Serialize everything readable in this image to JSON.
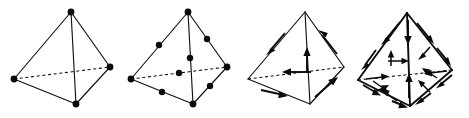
{
  "figure": {
    "background_color": "#ffffff",
    "ink_color": "#0a0a0a",
    "width": 469,
    "height": 118,
    "panel_count": 4,
    "caption": ""
  },
  "panels": [
    {
      "id": "panel-1",
      "name": "linear-nodal-tetrahedron",
      "label": "",
      "element_type": "nodal",
      "order": 1,
      "node_count": 4,
      "arrow_count": 0,
      "description": "Tetrahedron with solid edges, one dashed hidden edge, and filled circular nodes at the four corner vertices.",
      "origin_x": 0,
      "origin_y": 0,
      "vertices": {
        "apex": [
          71,
          12
        ],
        "left": [
          14,
          79
        ],
        "right": [
          110,
          67
        ],
        "bottom": [
          76,
          104
        ]
      },
      "nodes": [
        [
          71,
          12
        ],
        [
          14,
          79
        ],
        [
          110,
          67
        ],
        [
          76,
          104
        ]
      ],
      "edges_solid": [
        [
          "apex",
          "left"
        ],
        [
          "apex",
          "right"
        ],
        [
          "apex",
          "bottom"
        ],
        [
          "left",
          "bottom"
        ],
        [
          "right",
          "bottom"
        ]
      ],
      "edges_hidden": [
        [
          "left",
          "right"
        ]
      ]
    },
    {
      "id": "panel-2",
      "name": "quadratic-nodal-tetrahedron",
      "label": "",
      "element_type": "nodal",
      "order": 2,
      "node_count": 10,
      "arrow_count": 0,
      "description": "Tetrahedron with filled nodes at the four corners plus a midside node on each of the six edges, giving ten nodes.",
      "origin_x": 117,
      "origin_y": 0,
      "vertices": {
        "apex": [
          188,
          12
        ],
        "left": [
          131,
          79
        ],
        "right": [
          227,
          67
        ],
        "bottom": [
          193,
          104
        ]
      },
      "nodes": [
        [
          188,
          12
        ],
        [
          131,
          79
        ],
        [
          227,
          67
        ],
        [
          193,
          104
        ],
        [
          159,
          45
        ],
        [
          207,
          39
        ],
        [
          190,
          58
        ],
        [
          162,
          92
        ],
        [
          210,
          86
        ],
        [
          179,
          73
        ]
      ],
      "edges_solid": [
        [
          "apex",
          "left"
        ],
        [
          "apex",
          "right"
        ],
        [
          "apex",
          "bottom"
        ],
        [
          "left",
          "bottom"
        ],
        [
          "right",
          "bottom"
        ]
      ],
      "edges_hidden": [
        [
          "left",
          "right"
        ]
      ]
    },
    {
      "id": "panel-3",
      "name": "first-order-edge-tetrahedron",
      "label": "",
      "element_type": "edge",
      "order": 1,
      "node_count": 0,
      "arrow_count": 6,
      "description": "Tetrahedron whose six edges each carry a single tangential vector arrow at the edge midpoint.",
      "origin_x": 234,
      "origin_y": 0,
      "vertices": {
        "apex": [
          305,
          12
        ],
        "left": [
          248,
          79
        ],
        "right": [
          344,
          67
        ],
        "bottom": [
          310,
          104
        ]
      },
      "edges_solid": [
        [
          "apex",
          "left"
        ],
        [
          "apex",
          "right"
        ],
        [
          "apex",
          "bottom"
        ],
        [
          "left",
          "bottom"
        ],
        [
          "right",
          "bottom"
        ]
      ],
      "edges_hidden": [
        [
          "left",
          "right"
        ]
      ],
      "arrows": [
        {
          "name": "arrow-edge-apex-left",
          "from": [
            285,
            33
          ],
          "to": [
            266,
            55
          ],
          "direction": "down-left"
        },
        {
          "name": "arrow-edge-apex-right",
          "from": [
            337,
            54
          ],
          "to": [
            318,
            30
          ],
          "direction": "up-left"
        },
        {
          "name": "arrow-edge-apex-bottom",
          "from": [
            307,
            73
          ],
          "to": [
            307,
            48
          ],
          "direction": "up"
        },
        {
          "name": "arrow-edge-left-right",
          "from": [
            311,
            72
          ],
          "to": [
            282,
            72
          ],
          "direction": "left"
        },
        {
          "name": "arrow-edge-left-bottom",
          "from": [
            261,
            90
          ],
          "to": [
            288,
            96
          ],
          "direction": "down-right"
        },
        {
          "name": "arrow-edge-right-bottom",
          "from": [
            315,
            97
          ],
          "to": [
            338,
            77
          ],
          "direction": "up-right"
        }
      ]
    },
    {
      "id": "panel-4",
      "name": "second-order-edge-tetrahedron",
      "label": "",
      "element_type": "edge",
      "order": 2,
      "node_count": 0,
      "arrow_count": 20,
      "description": "Tetrahedron with two tangential vector arrows on each of the six edges and two vector arrows associated with each of the four faces, twenty degrees of freedom in total.",
      "origin_x": 350,
      "origin_y": 0,
      "vertices": {
        "apex": [
          407,
          13
        ],
        "left": [
          358,
          80
        ],
        "right": [
          452,
          70
        ],
        "bottom": [
          410,
          106
        ]
      },
      "edges_solid": [
        [
          "apex",
          "left"
        ],
        [
          "apex",
          "right"
        ],
        [
          "apex",
          "bottom"
        ],
        [
          "left",
          "bottom"
        ],
        [
          "right",
          "bottom"
        ]
      ],
      "edges_hidden": [
        [
          "left",
          "right"
        ]
      ],
      "arrows": [
        {
          "name": "arrow-edge-apex-left-a",
          "from": [
            398,
            24
          ],
          "to": [
            381,
            44
          ],
          "direction": "down-left"
        },
        {
          "name": "arrow-edge-apex-left-b",
          "from": [
            374,
            52
          ],
          "to": [
            362,
            70
          ],
          "direction": "down-left"
        },
        {
          "name": "arrow-edge-apex-right-a",
          "from": [
            419,
            25
          ],
          "to": [
            432,
            41
          ],
          "direction": "down-right"
        },
        {
          "name": "arrow-edge-apex-right-b",
          "from": [
            437,
            48
          ],
          "to": [
            449,
            63
          ],
          "direction": "down-right"
        },
        {
          "name": "arrow-edge-apex-bottom-a",
          "from": [
            408,
            22
          ],
          "to": [
            408,
            43
          ],
          "direction": "down"
        },
        {
          "name": "arrow-edge-apex-bottom-b",
          "from": [
            409,
            95
          ],
          "to": [
            409,
            74
          ],
          "direction": "up"
        },
        {
          "name": "arrow-edge-left-right-a",
          "from": [
            366,
            79
          ],
          "to": [
            389,
            76
          ],
          "direction": "right"
        },
        {
          "name": "arrow-edge-left-right-b",
          "from": [
            447,
            71
          ],
          "to": [
            424,
            74
          ],
          "direction": "left"
        },
        {
          "name": "arrow-edge-left-bottom-a",
          "from": [
            364,
            86
          ],
          "to": [
            379,
            95
          ],
          "direction": "down-right"
        },
        {
          "name": "arrow-edge-left-bottom-b",
          "from": [
            392,
            101
          ],
          "to": [
            406,
            107
          ],
          "direction": "down-right"
        },
        {
          "name": "arrow-edge-right-bottom-a",
          "from": [
            451,
            76
          ],
          "to": [
            437,
            88
          ],
          "direction": "down-left"
        },
        {
          "name": "arrow-edge-right-bottom-b",
          "from": [
            430,
            94
          ],
          "to": [
            416,
            104
          ],
          "direction": "down-left"
        },
        {
          "name": "arrow-face-front-a",
          "from": [
            391,
            66
          ],
          "to": [
            391,
            50
          ],
          "direction": "up"
        },
        {
          "name": "arrow-face-front-b",
          "from": [
            388,
            61
          ],
          "to": [
            409,
            61
          ],
          "direction": "right"
        },
        {
          "name": "arrow-face-right-a",
          "from": [
            429,
            48
          ],
          "to": [
            418,
            60
          ],
          "direction": "down-left"
        },
        {
          "name": "arrow-face-right-b",
          "from": [
            437,
            78
          ],
          "to": [
            423,
            68
          ],
          "direction": "up-left"
        },
        {
          "name": "arrow-face-bottom-a",
          "from": [
            374,
            82
          ],
          "to": [
            389,
            92
          ],
          "direction": "down-right"
        },
        {
          "name": "arrow-face-bottom-b",
          "from": [
            396,
            100
          ],
          "to": [
            381,
            90
          ],
          "direction": "up-left"
        },
        {
          "name": "arrow-face-left-a",
          "from": [
            429,
            92
          ],
          "to": [
            418,
            80
          ],
          "direction": "up-left"
        },
        {
          "name": "arrow-face-left-b",
          "from": [
            374,
            93
          ],
          "to": [
            389,
            85
          ],
          "direction": "up-right"
        }
      ]
    }
  ]
}
